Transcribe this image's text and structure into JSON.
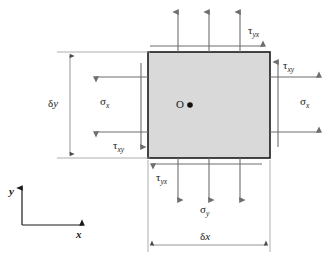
{
  "figure": {
    "colors": {
      "element_fill": "#d9d9d9",
      "element_stroke": "#1a1a1a",
      "arrow": "#6e6e6e",
      "dimension_line": "#8a8a8a",
      "text": "#1a1a1a",
      "background": "#ffffff"
    },
    "element": {
      "x": 148,
      "y": 52,
      "width": 122,
      "height": 106
    },
    "origin": {
      "label": "O",
      "marker": "filled-dot"
    },
    "labels": {
      "sigma_x_left": {
        "symbol": "σ",
        "subscript": "x"
      },
      "sigma_x_right": {
        "symbol": "σ",
        "subscript": "x"
      },
      "sigma_y_top": {
        "symbol": "σ",
        "subscript": "y"
      },
      "sigma_y_bottom": {
        "symbol": "σ",
        "subscript": "y"
      },
      "tau_yx_top": {
        "symbol": "τ",
        "subscript": "yx"
      },
      "tau_yx_bottom": {
        "symbol": "τ",
        "subscript": "yx"
      },
      "tau_xy_left": {
        "symbol": "τ",
        "subscript": "xy"
      },
      "tau_xy_right": {
        "symbol": "τ",
        "subscript": "xy"
      }
    },
    "dimensions": {
      "width_label": {
        "symbol": "δ",
        "variable": "x"
      },
      "height_label": {
        "symbol": "δ",
        "variable": "y"
      }
    },
    "axes": {
      "x_label": "x",
      "y_label": "y"
    }
  }
}
